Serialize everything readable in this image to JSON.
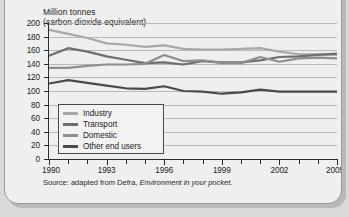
{
  "card": {
    "axis_title_line1": "Million tonnes",
    "axis_title_line2": "(carbon dioxide equivalent)",
    "source_prefix": "Source: adapted from Defra, ",
    "source_italic": "Environment in your pocket",
    "source_suffix": "."
  },
  "colors": {
    "industry": "#a8a8a8",
    "transport": "#6e6e6e",
    "domestic": "#8e8e8e",
    "other_end_users": "#4a4a4a",
    "gridline": "#b9b9b9",
    "axis": "#2b2b2b",
    "card_background": "#efefef",
    "page_background": "#d9d9d9"
  },
  "legend": {
    "items": [
      {
        "label": "Industry",
        "color": "#a8a8a8"
      },
      {
        "label": "Transport",
        "color": "#6e6e6e"
      },
      {
        "label": "Domestic",
        "color": "#8e8e8e"
      },
      {
        "label": "Other end users",
        "color": "#4a4a4a"
      }
    ]
  },
  "chart_data": {
    "type": "line",
    "title": "Million tonnes (carbon dioxide equivalent)",
    "xlabel": "",
    "ylabel": "Million tonnes (carbon dioxide equivalent)",
    "xlim": [
      1990,
      2005
    ],
    "ylim": [
      0,
      200
    ],
    "yticks": [
      0,
      20,
      40,
      60,
      80,
      100,
      120,
      140,
      160,
      180,
      200
    ],
    "ytick_labels": [
      "0",
      "20",
      "40",
      "60",
      "80",
      "100",
      "120",
      "140",
      "160",
      "180",
      "200"
    ],
    "xticks": [
      1990,
      1991,
      1992,
      1993,
      1994,
      1995,
      1996,
      1997,
      1998,
      1999,
      2000,
      2001,
      2002,
      2003,
      2004,
      2005
    ],
    "xtick_labels_major": [
      "1990",
      "1993",
      "1996",
      "1999",
      "2002",
      "2005"
    ],
    "xticks_major": [
      1990,
      1993,
      1996,
      1999,
      2002,
      2005
    ],
    "grid": true,
    "grid_axis": "y",
    "legend_position": "lower left inside",
    "x": [
      1990,
      1991,
      1992,
      1993,
      1994,
      1995,
      1996,
      1997,
      1998,
      1999,
      2000,
      2001,
      2002,
      2003,
      2004,
      2005
    ],
    "series": [
      {
        "name": "Industry",
        "color": "#a8a8a8",
        "values": [
          190,
          184,
          178,
          170,
          168,
          165,
          167,
          162,
          161,
          161,
          162,
          163,
          158,
          154,
          154,
          153
        ]
      },
      {
        "name": "Transport",
        "color": "#6e6e6e",
        "values": [
          152,
          163,
          158,
          151,
          146,
          141,
          142,
          139,
          144,
          142,
          142,
          145,
          150,
          151,
          153,
          155
        ]
      },
      {
        "name": "Domestic",
        "color": "#8e8e8e",
        "values": [
          134,
          134,
          137,
          139,
          139,
          140,
          153,
          144,
          145,
          141,
          141,
          150,
          143,
          148,
          149,
          148
        ]
      },
      {
        "name": "Other end users",
        "color": "#4a4a4a",
        "values": [
          111,
          116,
          112,
          108,
          104,
          103,
          107,
          100,
          99,
          96,
          98,
          102,
          99,
          99,
          99,
          99
        ]
      }
    ],
    "source": "Source: adapted from Defra, Environment in your pocket."
  }
}
